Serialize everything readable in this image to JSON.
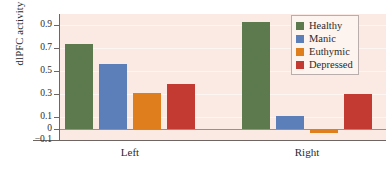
{
  "chart_data": {
    "type": "bar",
    "title": "",
    "xlabel": "",
    "ylabel": "dlPFC activity",
    "categories": [
      "Left",
      "Right"
    ],
    "series": [
      {
        "name": "Healthy",
        "color": "#5d7a4f",
        "values": [
          0.74,
          0.93
        ]
      },
      {
        "name": "Manic",
        "color": "#5d7fb9",
        "values": [
          0.56,
          0.11
        ]
      },
      {
        "name": "Euthymic",
        "color": "#df7e1d",
        "values": [
          0.31,
          -0.04
        ]
      },
      {
        "name": "Depressed",
        "color": "#c33a32",
        "values": [
          0.39,
          0.3
        ]
      }
    ],
    "ylim": [
      -0.1,
      1.0
    ],
    "yticks": [
      0.9,
      0.7,
      0.5,
      0.3,
      0.1,
      0,
      -0.1
    ],
    "ytick_labels": [
      "0.9",
      "0.7",
      "0.5",
      "0.3",
      "0.1",
      "0",
      "−0.1"
    ],
    "gridlines": [
      0.9,
      0.7,
      0.5,
      0.3,
      0.1
    ],
    "grid": true,
    "legend_position": "top-right",
    "plot_background": "#fbe9e4",
    "zero_line": 0
  }
}
